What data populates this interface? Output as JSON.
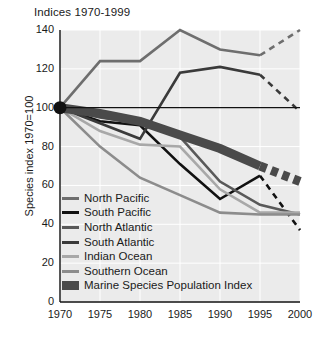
{
  "chart_data": {
    "type": "line",
    "title": "Indices 1970-1999",
    "xlabel": "",
    "ylabel": "Species index 1970=100",
    "xlim": [
      1970,
      2000
    ],
    "ylim": [
      0,
      140
    ],
    "xticks": [
      "1970",
      "1975",
      "1980",
      "1985",
      "1990",
      "1995",
      "2000"
    ],
    "yticks": [
      "0",
      "20",
      "40",
      "60",
      "80",
      "100",
      "120",
      "140"
    ],
    "grid": true,
    "legend_position": "inside-lower-left",
    "x": [
      1970,
      1975,
      1980,
      1985,
      1990,
      1995,
      2000
    ],
    "series": [
      {
        "name": "North Pacific",
        "color": "#6e6e6e",
        "width": 2.6,
        "values": [
          100,
          124,
          124,
          140,
          130,
          127,
          140
        ],
        "dashed_from": 1995
      },
      {
        "name": "South Pacific",
        "color": "#111111",
        "width": 2.6,
        "values": [
          100,
          93,
          91,
          71,
          53,
          65,
          37
        ],
        "dashed_from": 1995
      },
      {
        "name": "North Atlantic",
        "color": "#595959",
        "width": 2.6,
        "values": [
          100,
          95,
          92,
          85,
          62,
          50,
          45
        ],
        "dashed_from": null
      },
      {
        "name": "South Atlantic",
        "color": "#3a3a3a",
        "width": 2.6,
        "values": [
          100,
          92,
          84,
          118,
          121,
          117,
          98
        ],
        "dashed_from": 1995
      },
      {
        "name": "Indian Ocean",
        "color": "#a8a8a8",
        "width": 2.6,
        "values": [
          100,
          88,
          81,
          80,
          58,
          46,
          46
        ],
        "dashed_from": null
      },
      {
        "name": "Southern Ocean",
        "color": "#8c8c8c",
        "width": 2.6,
        "values": [
          100,
          80,
          64,
          55,
          46,
          45,
          45
        ],
        "dashed_from": null
      },
      {
        "name": "Marine Species Population Index",
        "color": "#4a4a4a",
        "width": 9,
        "values": [
          100,
          97,
          93,
          86,
          79,
          70,
          62
        ],
        "dashed_from": 1995
      }
    ],
    "origin_marker": {
      "x": 1970,
      "y": 100
    }
  }
}
